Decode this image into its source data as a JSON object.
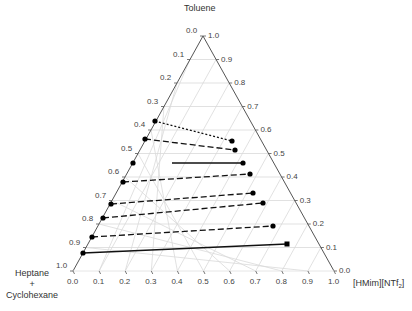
{
  "chart_data": {
    "type": "ternary",
    "title": "",
    "apex_labels": {
      "top": "Toluene",
      "bottom_left": [
        "Heptane",
        "+",
        "Cyclohexane"
      ],
      "bottom_right": "[HMim][NTf2]"
    },
    "axes": {
      "left_edge": {
        "component": "Heptane + Cyclohexane",
        "ticks": [
          "0.0",
          "0.1",
          "0.2",
          "0.3",
          "0.4",
          "0.5",
          "0.6",
          "0.7",
          "0.8",
          "0.9",
          "1.0"
        ]
      },
      "right_edge": {
        "component": "Toluene",
        "ticks": [
          "1.0",
          "0.9",
          "0.8",
          "0.7",
          "0.6",
          "0.5",
          "0.4",
          "0.3",
          "0.2",
          "0.1",
          "0.0"
        ]
      },
      "bottom_edge": {
        "component": "[HMim][NTf2]",
        "ticks": [
          "0.0",
          "0.1",
          "0.2",
          "0.3",
          "0.4",
          "0.5",
          "0.6",
          "0.7",
          "0.8",
          "0.9",
          "1.0"
        ]
      }
    },
    "grid": true,
    "tie_lines": [
      {
        "style": "dotted",
        "raffinate": {
          "toluene": 0.4,
          "ionic_liquid": 0.0
        },
        "extract": {
          "toluene": 0.55,
          "ionic_liquid": 0.39
        }
      },
      {
        "style": "dashed",
        "raffinate": {
          "toluene": 0.47,
          "ionic_liquid": 0.0
        },
        "extract": {
          "toluene": 0.51,
          "ionic_liquid": 0.45
        }
      },
      {
        "style": "solid",
        "raffinate": {
          "toluene": 0.46,
          "ionic_liquid": 0.14
        },
        "extract": {
          "toluene": 0.46,
          "ionic_liquid": 0.5
        }
      },
      {
        "style": "dashed",
        "raffinate": {
          "toluene": 0.38,
          "ionic_liquid": 0.0
        },
        "extract": {
          "toluene": 0.41,
          "ionic_liquid": 0.59
        }
      },
      {
        "style": "dashed",
        "raffinate": {
          "toluene": 0.3,
          "ionic_liquid": 0.0
        },
        "extract": {
          "toluene": 0.33,
          "ionic_liquid": 0.64
        }
      },
      {
        "style": "dashed",
        "raffinate": {
          "toluene": 0.23,
          "ionic_liquid": 0.0
        },
        "extract": {
          "toluene": 0.29,
          "ionic_liquid": 0.72
        }
      },
      {
        "style": "dashed",
        "raffinate": {
          "toluene": 0.18,
          "ionic_liquid": 0.0
        },
        "extract": {
          "toluene": 0.19,
          "ionic_liquid": 0.8
        }
      },
      {
        "style": "dashed",
        "raffinate": {
          "toluene": 0.1,
          "ionic_liquid": 0.0
        },
        "extract": {
          "toluene": 0.12,
          "ionic_liquid": 0.78
        }
      },
      {
        "style": "solid",
        "raffinate": {
          "toluene": 0.06,
          "ionic_liquid": 0.0
        },
        "extract": {
          "toluene": 0.11,
          "ionic_liquid": 0.85
        }
      }
    ],
    "extra_points": [
      {
        "toluene": 0.38,
        "ionic_liquid": 0.0
      }
    ]
  },
  "labels": {
    "top": "Toluene",
    "bl_line1": "Heptane",
    "bl_line2": "+",
    "bl_line3": "Cyclohexane",
    "br_main": "[HMim][NTf",
    "br_sub": "2",
    "br_end": "]"
  },
  "geometry": {
    "apex": [
      203,
      36
    ],
    "left": [
      73,
      271
    ],
    "right": [
      334,
      271
    ]
  },
  "tie_lines_px": [
    {
      "style": "dotted",
      "x1": 155,
      "y1": 121,
      "x2": 232,
      "y2": 141
    },
    {
      "style": "dashed",
      "x1": 145,
      "y1": 139,
      "x2": 235,
      "y2": 150
    },
    {
      "style": "solid",
      "x1": 172,
      "y1": 163,
      "x2": 243,
      "y2": 163,
      "no_start_dot": true
    },
    {
      "style": "dashed",
      "x1": 123,
      "y1": 182,
      "x2": 250,
      "y2": 174
    },
    {
      "style": "dashed",
      "x1": 111,
      "y1": 204,
      "x2": 253,
      "y2": 193
    },
    {
      "style": "dashed",
      "x1": 103,
      "y1": 218,
      "x2": 263,
      "y2": 203
    },
    {
      "style": "dashed",
      "x1": 92,
      "y1": 237,
      "x2": 273,
      "y2": 226
    },
    {
      "style": "solid",
      "x1": 83,
      "y1": 253,
      "x2": 287,
      "y2": 244,
      "square_end": true
    }
  ],
  "loose_points_px": [
    [
      133,
      163
    ]
  ]
}
